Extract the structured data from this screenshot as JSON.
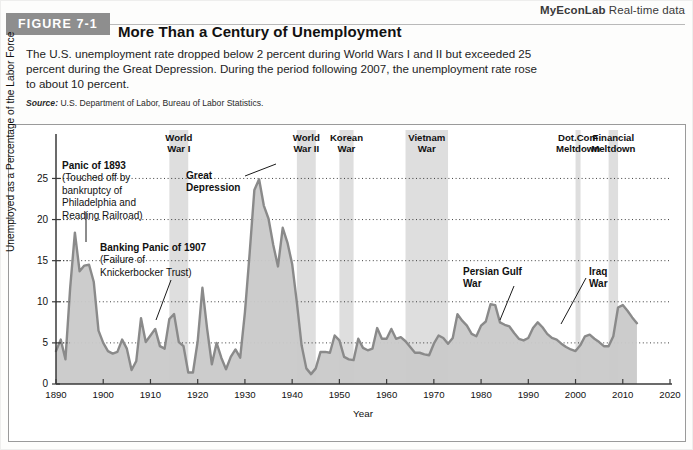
{
  "header": {
    "myeconlab_brand": "MyEconLab",
    "myeconlab_suffix": " Real-time data",
    "figure_badge": "FIGURE 7-1",
    "title": "More Than a Century of Unemployment",
    "description": "The U.S. unemployment rate dropped below 2 percent during World Wars I and II but exceeded 25 percent during the Great Depression. During the period following 2007, the unemployment rate rose to about 10 percent.",
    "source_label": "Source:",
    "source_text": " U.S. Department of Labor, Bureau of Labor Statistics."
  },
  "chart_data": {
    "type": "area",
    "title": "More Than a Century of Unemployment",
    "xlabel": "Year",
    "ylabel": "Unemployed as a Percentage of the Labor Force",
    "xlim": [
      1890,
      2020
    ],
    "ylim": [
      0,
      27
    ],
    "yticks": [
      0,
      5,
      10,
      15,
      20,
      25
    ],
    "xticks": [
      1890,
      1900,
      1910,
      1920,
      1930,
      1940,
      1950,
      1960,
      1970,
      1980,
      1990,
      2000,
      2010,
      2020
    ],
    "grid": "horizontal-dotted",
    "legend": "none",
    "series_name": "U.S. unemployment rate",
    "line_color": "#8a8a8a",
    "fill_color": "#c9c9c9",
    "band_color": "#d8d8d8",
    "x": [
      1890,
      1891,
      1892,
      1893,
      1894,
      1895,
      1896,
      1897,
      1898,
      1899,
      1900,
      1901,
      1902,
      1903,
      1904,
      1905,
      1906,
      1907,
      1908,
      1909,
      1910,
      1911,
      1912,
      1913,
      1914,
      1915,
      1916,
      1917,
      1918,
      1919,
      1920,
      1921,
      1922,
      1923,
      1924,
      1925,
      1926,
      1927,
      1928,
      1929,
      1930,
      1931,
      1932,
      1933,
      1934,
      1935,
      1936,
      1937,
      1938,
      1939,
      1940,
      1941,
      1942,
      1943,
      1944,
      1945,
      1946,
      1947,
      1948,
      1949,
      1950,
      1951,
      1952,
      1953,
      1954,
      1955,
      1956,
      1957,
      1958,
      1959,
      1960,
      1961,
      1962,
      1963,
      1964,
      1965,
      1966,
      1967,
      1968,
      1969,
      1970,
      1971,
      1972,
      1973,
      1974,
      1975,
      1976,
      1977,
      1978,
      1979,
      1980,
      1981,
      1982,
      1983,
      1984,
      1985,
      1986,
      1987,
      1988,
      1989,
      1990,
      1991,
      1992,
      1993,
      1994,
      1995,
      1996,
      1997,
      1998,
      1999,
      2000,
      2001,
      2002,
      2003,
      2004,
      2005,
      2006,
      2007,
      2008,
      2009,
      2010,
      2011,
      2012,
      2013
    ],
    "values": [
      4.0,
      5.4,
      3.0,
      11.7,
      18.4,
      13.7,
      14.4,
      14.5,
      12.4,
      6.5,
      5.0,
      4.0,
      3.7,
      3.9,
      5.4,
      4.3,
      1.7,
      2.8,
      8.0,
      5.1,
      5.9,
      6.7,
      4.6,
      4.3,
      7.9,
      8.5,
      5.1,
      4.6,
      1.4,
      1.4,
      5.2,
      11.7,
      6.7,
      2.4,
      5.0,
      3.2,
      1.8,
      3.3,
      4.2,
      3.2,
      8.7,
      15.9,
      23.6,
      24.9,
      21.7,
      20.1,
      16.9,
      14.3,
      19.0,
      17.2,
      14.6,
      9.9,
      4.7,
      1.9,
      1.2,
      1.9,
      3.9,
      3.9,
      3.8,
      5.9,
      5.3,
      3.3,
      3.0,
      2.9,
      5.5,
      4.4,
      4.1,
      4.3,
      6.8,
      5.5,
      5.5,
      6.7,
      5.5,
      5.7,
      5.2,
      4.5,
      3.8,
      3.8,
      3.6,
      3.5,
      4.9,
      5.9,
      5.6,
      4.9,
      5.6,
      8.5,
      7.7,
      7.1,
      6.1,
      5.8,
      7.1,
      7.6,
      9.7,
      9.6,
      7.5,
      7.2,
      7.0,
      6.2,
      5.5,
      5.3,
      5.6,
      6.8,
      7.5,
      6.9,
      6.1,
      5.6,
      5.4,
      4.9,
      4.5,
      4.2,
      4.0,
      4.7,
      5.8,
      6.0,
      5.5,
      5.1,
      4.6,
      4.6,
      5.8,
      9.3,
      9.6,
      8.9,
      8.1,
      7.4
    ]
  },
  "bands": [
    {
      "name": "World War I",
      "label_line1": "World",
      "label_line2": "War I",
      "start": 1914,
      "end": 1918
    },
    {
      "name": "World War II",
      "label_line1": "World",
      "label_line2": "War II",
      "start": 1941,
      "end": 1945
    },
    {
      "name": "Korean War",
      "label_line1": "Korean",
      "label_line2": "War",
      "start": 1950,
      "end": 1953
    },
    {
      "name": "Vietnam War",
      "label_line1": "Vietnam",
      "label_line2": "War",
      "start": 1964,
      "end": 1973
    },
    {
      "name": "Dot.Com Meltdown",
      "label_line1": "Dot.Com",
      "label_line2": "Meltdown",
      "start": 2000,
      "end": 2001
    },
    {
      "name": "Financial Meltdown",
      "label_line1": "Financial",
      "label_line2": "Meltdown",
      "start": 2007,
      "end": 2009
    }
  ],
  "annotations": {
    "panic1893_title": "Panic of 1893",
    "panic1893_line1": "(Touched off by",
    "panic1893_line2": "bankruptcy of",
    "panic1893_line3": "Philadelphia and",
    "panic1893_line4": "Reading Railroad)",
    "panic1907_title": "Banking Panic of 1907",
    "panic1907_line1": "(Failure of",
    "panic1907_line2": "Knickerbocker Trust)",
    "great_depression_line1": "Great",
    "great_depression_line2": "Depression",
    "persian_gulf_line1": "Persian Gulf",
    "persian_gulf_line2": "War",
    "iraq_line1": "Iraq",
    "iraq_line2": "War"
  }
}
